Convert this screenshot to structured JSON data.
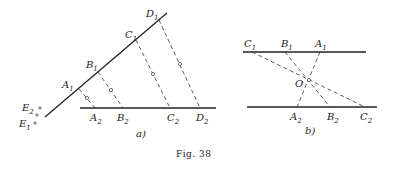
{
  "figure": {
    "caption": "Fig. 38",
    "panels": [
      {
        "id": "a",
        "label": "a)",
        "points": {
          "A1": "A",
          "B1": "B",
          "C1": "C",
          "D1": "D",
          "A2": "A",
          "B2": "B",
          "C2": "C",
          "D2": "D",
          "E1": "E",
          "E2": "E"
        },
        "subscripts": {
          "one": "1",
          "two": "2"
        }
      },
      {
        "id": "b",
        "label": "b)",
        "points": {
          "A1": "A",
          "B1": "B",
          "C1": "C",
          "A2": "A",
          "B2": "B",
          "C2": "C",
          "O": "O"
        }
      }
    ]
  }
}
